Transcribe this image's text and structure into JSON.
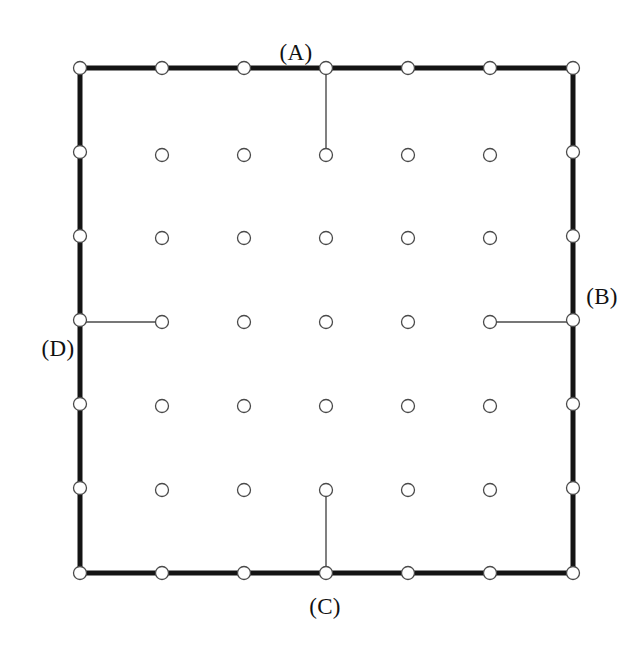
{
  "figure": {
    "kind": "diagram",
    "background_color": "#ffffff",
    "canvas": {
      "width": 644,
      "height": 648
    }
  },
  "square": {
    "name": "outer-square-boundary",
    "left": 80,
    "top": 68,
    "right": 573,
    "bottom": 573,
    "side_length": 493,
    "stroke_color": "#141414",
    "stroke_width": 5
  },
  "nodes": {
    "stroke_color": "#4a4a4a",
    "fill_color": "#ffffff",
    "radius": 6.5,
    "boundary": {
      "per_edge_count": 7,
      "spacing": 82.17,
      "top_y": 68,
      "bottom_y": 573,
      "left_x": 80,
      "right_x": 573,
      "x_positions": [
        80,
        162,
        244,
        326,
        409,
        491,
        573
      ],
      "y_positions": [
        68,
        150,
        232,
        314,
        397,
        479,
        573
      ],
      "edge_y_positions": [
        68,
        152,
        236,
        320,
        404,
        488,
        573
      ],
      "edge_x_positions": [
        80,
        162,
        244,
        326,
        408,
        490,
        573
      ],
      "total_count": 24
    },
    "interior": {
      "rows": 5,
      "columns": 5,
      "x_positions": [
        162,
        244,
        326,
        408,
        490
      ],
      "y_positions": [
        155,
        238,
        322,
        406,
        490
      ],
      "total_count": 25
    }
  },
  "connectors": [
    {
      "id": "A",
      "label": "(A)",
      "name": "connector-a",
      "orientation": "vertical",
      "from": {
        "type": "boundary-node",
        "edge": "top",
        "index": 3,
        "x": 326,
        "y": 68
      },
      "to": {
        "type": "interior-node",
        "row": 0,
        "column": 2,
        "x": 326,
        "y": 155
      },
      "label_position": {
        "x": 296,
        "y": 52
      },
      "stroke_color": "#4a4a4a",
      "stroke_width": 1.4
    },
    {
      "id": "B",
      "label": "(B)",
      "name": "connector-b",
      "orientation": "horizontal",
      "from": {
        "type": "interior-node",
        "row": 2,
        "column": 4,
        "x": 490,
        "y": 322
      },
      "to": {
        "type": "boundary-node",
        "edge": "right",
        "index": 3,
        "x": 573,
        "y": 322
      },
      "label_position": {
        "x": 602,
        "y": 296
      },
      "stroke_color": "#4a4a4a",
      "stroke_width": 1.4
    },
    {
      "id": "C",
      "label": "(C)",
      "name": "connector-c",
      "orientation": "vertical",
      "from": {
        "type": "interior-node",
        "row": 4,
        "column": 2,
        "x": 326,
        "y": 490
      },
      "to": {
        "type": "boundary-node",
        "edge": "bottom",
        "index": 3,
        "x": 326,
        "y": 573
      },
      "label_position": {
        "x": 325,
        "y": 606
      },
      "stroke_color": "#4a4a4a",
      "stroke_width": 1.4
    },
    {
      "id": "D",
      "label": "(D)",
      "name": "connector-d",
      "orientation": "horizontal",
      "from": {
        "type": "boundary-node",
        "edge": "left",
        "index": 3,
        "x": 80,
        "y": 322
      },
      "to": {
        "type": "interior-node",
        "row": 2,
        "column": 0,
        "x": 162,
        "y": 322
      },
      "label_position": {
        "x": 58,
        "y": 348
      },
      "stroke_color": "#4a4a4a",
      "stroke_width": 1.4
    }
  ]
}
